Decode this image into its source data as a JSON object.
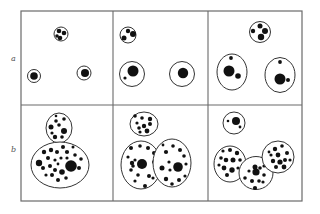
{
  "figure": {
    "row_labels": [
      "a",
      "b"
    ],
    "stroke_color": "#333333",
    "grid_color": "#6a6a6a",
    "fill_color": "#111111",
    "panels": [
      {
        "row": "a",
        "col": 1,
        "cells": [
          {
            "cx": 61,
            "cy": 34,
            "rx": 7,
            "ry": 7,
            "dots": [
              [
                59,
                31,
                2.3
              ],
              [
                64,
                33,
                2.3
              ],
              [
                60,
                38,
                2.3
              ],
              [
                57,
                36,
                1.8
              ]
            ]
          },
          {
            "cx": 34,
            "cy": 76,
            "rx": 6.5,
            "ry": 6.5,
            "dots": [
              [
                34,
                76,
                3.8
              ]
            ]
          },
          {
            "cx": 84,
            "cy": 73,
            "rx": 7,
            "ry": 7,
            "dots": [
              [
                85,
                73,
                4
              ]
            ]
          }
        ]
      },
      {
        "row": "a",
        "col": 2,
        "cells": [
          {
            "cx": 128,
            "cy": 35,
            "rx": 8,
            "ry": 8,
            "dots": [
              [
                128,
                31,
                2.2
              ],
              [
                133,
                34,
                3
              ],
              [
                124,
                38,
                2.5
              ]
            ]
          },
          {
            "cx": 132,
            "cy": 74,
            "rx": 12.5,
            "ry": 12.5,
            "dots": [
              [
                133,
                71,
                5.5
              ],
              [
                125,
                78,
                1.6
              ]
            ]
          },
          {
            "cx": 182,
            "cy": 74,
            "rx": 12.5,
            "ry": 12.5,
            "dots": [
              [
                183,
                73,
                5.2
              ]
            ]
          }
        ]
      },
      {
        "row": "a",
        "col": 3,
        "cells": [
          {
            "cx": 260,
            "cy": 32,
            "rx": 10.5,
            "ry": 10.5,
            "dots": [
              [
                260,
                26,
                2.5
              ],
              [
                265,
                31,
                3
              ],
              [
                253,
                31,
                2.2
              ],
              [
                261,
                37,
                3.2
              ]
            ]
          },
          {
            "cx": 232,
            "cy": 72,
            "rx": 15,
            "ry": 18,
            "dots": [
              [
                229,
                71,
                5.5
              ],
              [
                238,
                76,
                2.8
              ],
              [
                231,
                58,
                1.9
              ]
            ]
          },
          {
            "cx": 280,
            "cy": 75,
            "rx": 15,
            "ry": 17.5,
            "dots": [
              [
                280,
                79,
                5.5
              ],
              [
                288,
                80,
                2
              ],
              [
                280,
                62,
                1.9
              ]
            ]
          }
        ]
      },
      {
        "row": "b",
        "col": 1,
        "cells": [
          {
            "cx": 59,
            "cy": 128,
            "rx": 13,
            "ry": 15,
            "dots": [
              [
                56,
                121,
                1.8
              ],
              [
                64,
                119,
                1.8
              ],
              [
                51,
                127,
                2.5
              ],
              [
                59,
                125,
                1.8
              ],
              [
                64,
                131,
                3
              ],
              [
                55,
                137,
                2.2
              ],
              [
                62,
                137,
                1.8
              ],
              [
                52,
                133,
                1.6
              ],
              [
                56,
                116,
                1.3
              ]
            ]
          },
          {
            "cx": 60,
            "cy": 165,
            "rx": 29,
            "ry": 23,
            "dots": [
              [
                71,
                166,
                5.8
              ],
              [
                39,
                163,
                3.2
              ],
              [
                44,
                152,
                2.2
              ],
              [
                51,
                150,
                2.2
              ],
              [
                57,
                152,
                2
              ],
              [
                63,
                147,
                2
              ],
              [
                67,
                152,
                2.1
              ],
              [
                75,
                155,
                1.8
              ],
              [
                55,
                160,
                1.6
              ],
              [
                61,
                158,
                1.6
              ],
              [
                67,
                158,
                1.6
              ],
              [
                48,
                158,
                2
              ],
              [
                43,
                168,
                2
              ],
              [
                50,
                166,
                2
              ],
              [
                55,
                170,
                2
              ],
              [
                62,
                172,
                2.8
              ],
              [
                52,
                175,
                2
              ],
              [
                58,
                180,
                2
              ],
              [
                66,
                178,
                1.8
              ],
              [
                81,
                159,
                1.8
              ],
              [
                79,
                168,
                2
              ],
              [
                46,
                175,
                1.6
              ],
              [
                73,
                147,
                1.5
              ],
              [
                58,
                164,
                1.4
              ]
            ]
          }
        ]
      },
      {
        "row": "b",
        "col": 2,
        "cells": [
          {
            "cx": 144,
            "cy": 124,
            "rx": 14,
            "ry": 12,
            "dots": [
              [
                135,
                116,
                1.8
              ],
              [
                142,
                118,
                1.8
              ],
              [
                150,
                119,
                2.2
              ],
              [
                137,
                123,
                1.6
              ],
              [
                144,
                126,
                2.2
              ],
              [
                150,
                124,
                2
              ],
              [
                139,
                128,
                1.8
              ],
              [
                147,
                131,
                2.4
              ],
              [
                140,
                132,
                1.6
              ]
            ]
          },
          {
            "cx": 141,
            "cy": 165,
            "rx": 20,
            "ry": 24,
            "dots": [
              [
                142,
                164,
                5
              ],
              [
                131,
                148,
                2
              ],
              [
                140,
                146,
                1.8
              ],
              [
                148,
                148,
                2
              ],
              [
                154,
                153,
                2
              ],
              [
                128,
                157,
                1.6
              ],
              [
                132,
                163,
                2.2
              ],
              [
                135,
                160,
                1.6
              ],
              [
                154,
                162,
                2
              ],
              [
                131,
                170,
                1.8
              ],
              [
                138,
                175,
                1.8
              ],
              [
                149,
                176,
                2
              ],
              [
                135,
                181,
                1.6
              ],
              [
                145,
                186,
                2
              ],
              [
                153,
                178,
                1.6
              ],
              [
                133,
                166,
                1.8
              ]
            ]
          },
          {
            "cx": 172,
            "cy": 163,
            "rx": 19,
            "ry": 24,
            "dots": [
              [
                178,
                167,
                4.8
              ],
              [
                166,
                152,
                2.1
              ],
              [
                173,
                146,
                1.8
              ],
              [
                180,
                150,
                2
              ],
              [
                184,
                156,
                1.8
              ],
              [
                169,
                162,
                1.6
              ],
              [
                162,
                168,
                2.5
              ],
              [
                170,
                170,
                1.6
              ],
              [
                186,
                164,
                1.6
              ],
              [
                166,
                179,
                2.2
              ],
              [
                172,
                184,
                1.8
              ],
              [
                179,
                180,
                2
              ],
              [
                185,
                176,
                1.6
              ],
              [
                163,
                145,
                1.4
              ]
            ]
          }
        ]
      },
      {
        "row": "b",
        "col": 3,
        "cells": [
          {
            "cx": 234,
            "cy": 123,
            "rx": 11,
            "ry": 11,
            "dots": [
              [
                236,
                121,
                4
              ],
              [
                228,
                121,
                1.3
              ],
              [
                240,
                127,
                1.4
              ]
            ]
          },
          {
            "cx": 230,
            "cy": 164,
            "rx": 16,
            "ry": 18,
            "dots": [
              [
                223,
                151,
                1.6
              ],
              [
                230,
                150,
                2
              ],
              [
                237,
                153,
                2.2
              ],
              [
                221,
                158,
                1.8
              ],
              [
                226,
                160,
                2.3
              ],
              [
                233,
                160,
                2.5
              ],
              [
                240,
                160,
                1.8
              ],
              [
                219,
                165,
                1.6
              ],
              [
                224,
                168,
                2.4
              ],
              [
                232,
                170,
                2.7
              ],
              [
                227,
                175,
                2
              ],
              [
                238,
                168,
                1.6
              ]
            ]
          },
          {
            "cx": 256,
            "cy": 173,
            "rx": 17,
            "ry": 16.5,
            "dots": [
              [
                255,
                167,
                2.5
              ],
              [
                260,
                168,
                1.8
              ],
              [
                264,
                166,
                1.6
              ],
              [
                249,
                171,
                1.6
              ],
              [
                256,
                172,
                3.6
              ],
              [
                264,
                175,
                1.8
              ],
              [
                245,
                178,
                1.8
              ],
              [
                252,
                181,
                2
              ],
              [
                259,
                181,
                1.8
              ],
              [
                263,
                182,
                1.6
              ],
              [
                255,
                188,
                2.1
              ]
            ]
          },
          {
            "cx": 278,
            "cy": 157,
            "rx": 16,
            "ry": 16,
            "dots": [
              [
                275,
                149,
                2.2
              ],
              [
                282,
                146,
                1.8
              ],
              [
                287,
                153,
                2
              ],
              [
                271,
                155,
                1.6
              ],
              [
                278,
                155,
                2.4
              ],
              [
                285,
                160,
                2
              ],
              [
                273,
                161,
                2.2
              ],
              [
                280,
                162,
                2.6
              ],
              [
                290,
                160,
                1.6
              ],
              [
                276,
                167,
                2
              ],
              [
                284,
                167,
                2.4
              ],
              [
                269,
                152,
                1.4
              ]
            ]
          }
        ]
      }
    ]
  }
}
